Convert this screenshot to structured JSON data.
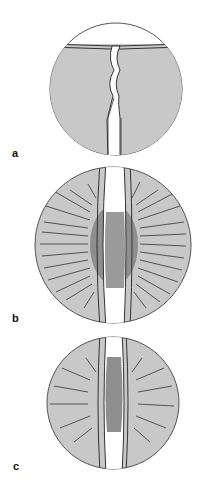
{
  "panels": [
    {
      "label": "a",
      "description": "crack propagating through sheet, no surrounding changes"
    },
    {
      "label": "b",
      "description": "widened crack with dark inner zone and many radiating fine cracks"
    },
    {
      "label": "c",
      "description": "crack with dark inner zone and fewer, shorter radiating cracks"
    }
  ],
  "colors": {
    "disc_fill": "#c8c8c8",
    "disc_outline": "#555555",
    "channel": "#ffffff",
    "dark_zone": "#8e8e8e",
    "crack_line": "#333333"
  }
}
